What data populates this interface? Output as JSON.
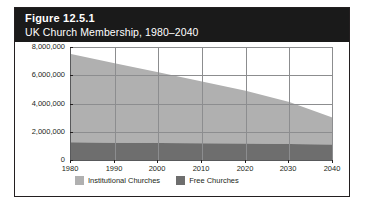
{
  "figure": {
    "number": "Figure 12.5.1",
    "title": "UK Church Membership, 1980–2040"
  },
  "colors": {
    "header_background": "#1a1a1a",
    "header_text": "#ffffff",
    "frame_border": "#231f20",
    "institutional_churches": "#b0b0b0",
    "free_churches": "#6e6e6e",
    "gridline": "#8c8d8f",
    "axis": "#58595b",
    "plot_background": "#ffffff"
  },
  "chart_data": {
    "type": "area",
    "stacked": true,
    "title": "UK Church Membership, 1980–2040",
    "xlabel": "",
    "ylabel": "",
    "x": [
      1980,
      1990,
      2000,
      2010,
      2020,
      2030,
      2040
    ],
    "categories": [
      "1980",
      "1990",
      "2000",
      "2010",
      "2020",
      "2030",
      "2040"
    ],
    "xlim": [
      1980,
      2040
    ],
    "ylim": [
      0,
      8000000
    ],
    "yticks": [
      0,
      2000000,
      4000000,
      6000000,
      8000000
    ],
    "ytick_labels": [
      "0",
      "2,000,000",
      "4,000,000",
      "6,000,000",
      "8,000,000"
    ],
    "xticks": [
      1980,
      1990,
      2000,
      2010,
      2020,
      2030,
      2040
    ],
    "xtick_labels": [
      "1980",
      "1990",
      "2000",
      "2010",
      "2020",
      "2030",
      "2040"
    ],
    "grid": true,
    "legend_position": "bottom-left",
    "series": [
      {
        "name": "Free Churches",
        "color": "#6e6e6e",
        "values": [
          1250000,
          1230000,
          1210000,
          1190000,
          1160000,
          1130000,
          1100000
        ]
      },
      {
        "name": "Institutional Churches",
        "color": "#b0b0b0",
        "values": [
          6250000,
          5620000,
          5000000,
          4360000,
          3740000,
          2970000,
          1900000
        ]
      }
    ],
    "totals": [
      7500000,
      6850000,
      6210000,
      5550000,
      4900000,
      4100000,
      3000000
    ]
  },
  "legend": {
    "items": [
      {
        "label": "Institutional Churches",
        "color": "#b0b0b0"
      },
      {
        "label": "Free Churches",
        "color": "#6e6e6e"
      }
    ]
  }
}
